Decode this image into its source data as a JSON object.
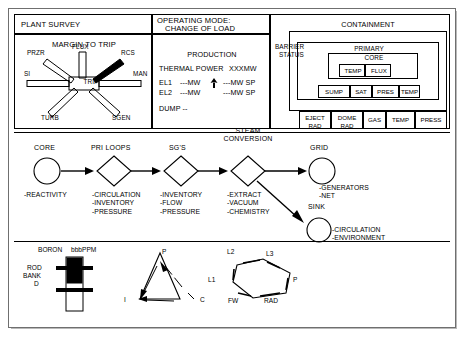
{
  "panels": {
    "plant_survey_title": "PLANT SURVEY",
    "operating_mode_title": "OPERATING MODE:",
    "operating_mode_value": "CHANGE OF LOAD",
    "barrier_status_line1": "BARRIER",
    "barrier_status_line2": "STATUS",
    "containment_title": "CONTAINMENT",
    "primary_title": "PRIMARY",
    "core_title": "CORE"
  },
  "margin_to_trip": {
    "title": "MARGIN TO TRIP",
    "center_label": "TRIP",
    "spokes": [
      {
        "name": "PRZR",
        "filled": false
      },
      {
        "name": "FLUX",
        "filled": false
      },
      {
        "name": "RCS",
        "filled": true
      },
      {
        "name": "MAN",
        "filled": false
      },
      {
        "name": "SGEN",
        "filled": false
      },
      {
        "name": "TURB",
        "filled": false
      },
      {
        "name": "SI",
        "filled": false
      }
    ]
  },
  "production": {
    "title": "PRODUCTION",
    "thermal_power_label": "THERMAL POWER",
    "thermal_power_value": "XXXMW",
    "rows": [
      {
        "label": "EL1",
        "value": "---MW",
        "setpoint": "---MW SP"
      },
      {
        "label": "EL2",
        "value": "---MW",
        "setpoint": "---MW SP"
      }
    ],
    "dump_label": "DUMP --"
  },
  "containment_core_boxes": [
    {
      "label": "TEMP"
    },
    {
      "label": "FLUX"
    }
  ],
  "containment_primary_boxes": [
    {
      "label": "SUMP"
    },
    {
      "label": "SAT"
    },
    {
      "label": "PRES"
    },
    {
      "label": "INV"
    }
  ],
  "containment_bottom_boxes": [
    {
      "line1": "EJECT",
      "line2": "RAD"
    },
    {
      "line1": "DOME",
      "line2": "RAD"
    },
    {
      "line1": "GAS",
      "line2": ""
    },
    {
      "line1": "TEMP",
      "line2": ""
    },
    {
      "line1": "PRESS",
      "line2": ""
    }
  ],
  "flow_nodes": [
    {
      "id": "core",
      "title": "CORE",
      "shape": "circle",
      "bullets": [
        "-REACTIVITY"
      ]
    },
    {
      "id": "pri",
      "title": "PRI LOOPS",
      "shape": "diamond",
      "bullets": [
        "-CIRCULATION",
        "-INVENTORY",
        "-PRESSURE"
      ]
    },
    {
      "id": "sg",
      "title": "SG'S",
      "shape": "diamond",
      "bullets": [
        "-INVENTORY",
        "-FLOW",
        "-PRESSURE"
      ]
    },
    {
      "id": "steam",
      "title": "STEAM\nCONVERSION",
      "shape": "diamond",
      "bullets": [
        "-EXTRACT",
        "-VACUUM",
        "-CHEMISTRY"
      ]
    },
    {
      "id": "grid",
      "title": "GRID",
      "shape": "circle",
      "bullets": [
        "-GENERATORS",
        "-NET"
      ]
    },
    {
      "id": "sink",
      "title": "SINK",
      "shape": "circle",
      "bullets": [
        "-CIRCULATION",
        "-ENVIRONMENT"
      ]
    }
  ],
  "flow_titles": {
    "core": "CORE",
    "pri": "PRI LOOPS",
    "sg": "SG'S",
    "steam_l1": "STEAM",
    "steam_l2": "CONVERSION",
    "grid": "GRID",
    "sink": "SINK"
  },
  "flow_bullets": {
    "core": "-REACTIVITY",
    "pri": "-CIRCULATION\n-INVENTORY\n-PRESSURE",
    "sg": "-INVENTORY\n-FLOW\n-PRESSURE",
    "steam": "-EXTRACT\n-VACUUM\n-CHEMISTRY",
    "grid": "-GENERATORS\n-NET",
    "sink": "-CIRCULATION\n-ENVIRONMENT"
  },
  "boron": {
    "label": "BORON",
    "value": "bbbPPM",
    "rod_bank_l1": "ROD",
    "rod_bank_l2": "BANK",
    "rod_bank_l3": "D"
  },
  "triangle_diagram": {
    "vertices": [
      {
        "label": "P"
      },
      {
        "label": "I"
      },
      {
        "label": "C"
      }
    ],
    "p": "P",
    "i": "I",
    "c": "C"
  },
  "hexagon_diagram": {
    "vertices": [
      {
        "label": "L2"
      },
      {
        "label": "L3"
      },
      {
        "label": "P"
      },
      {
        "label": "RAD"
      },
      {
        "label": "FW"
      },
      {
        "label": "L1"
      }
    ],
    "l1": "L1",
    "l2": "L2",
    "l3": "L3",
    "p": "P",
    "rad": "RAD",
    "fw": "FW"
  },
  "colors": {
    "ink": "#000000",
    "chassis": "#6f6f6f",
    "paper": "#ffffff"
  }
}
